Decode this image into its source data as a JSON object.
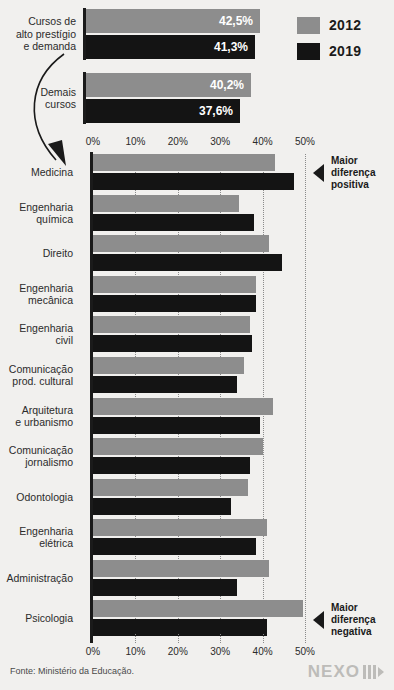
{
  "legend": {
    "items": [
      {
        "label": "2012",
        "color": "#8d8d8d"
      },
      {
        "label": "2019",
        "color": "#141414"
      }
    ]
  },
  "summary": {
    "groups": [
      {
        "label": "Cursos de alto prestígio e demanda",
        "bars": [
          {
            "series": "2012",
            "value": 42.5,
            "value_label": "42,5%"
          },
          {
            "series": "2019",
            "value": 41.3,
            "value_label": "41,3%"
          }
        ]
      },
      {
        "label": "Demais cursos",
        "bars": [
          {
            "series": "2012",
            "value": 40.2,
            "value_label": "40,2%"
          },
          {
            "series": "2019",
            "value": 37.6,
            "value_label": "37,6%"
          }
        ]
      }
    ]
  },
  "callouts": [
    {
      "id": "maior-diferenca-positiva",
      "text": "Maior diferença positiva",
      "icon": "triangle-left-icon"
    },
    {
      "id": "maior-diferenca-negativa",
      "text": "Maior diferença negativa",
      "icon": "triangle-left-icon"
    }
  ],
  "footer": {
    "source": "Fonte: Ministério da Educação.",
    "logo": "NEXO"
  },
  "chart_data": {
    "type": "bar",
    "orientation": "horizontal",
    "title": "",
    "subtitle": "",
    "xlabel": "",
    "ylabel": "",
    "xlim": [
      0,
      50
    ],
    "grid": true,
    "legend_position": "top-right",
    "tick_labels": [
      "0%",
      "10%",
      "20%",
      "30%",
      "40%",
      "50%"
    ],
    "ticks": [
      0,
      10,
      20,
      30,
      40,
      50
    ],
    "categories": [
      "Medicina",
      "Engenharia química",
      "Direito",
      "Engenharia mecânica",
      "Engenharia civil",
      "Comunicação prod. cultural",
      "Arquitetura e urbanismo",
      "Comunicação jornalismo",
      "Odontologia",
      "Engenharia elétrica",
      "Administração",
      "Psicologia"
    ],
    "category_lines": [
      [
        "Medicina"
      ],
      [
        "Engenharia",
        "química"
      ],
      [
        "Direito"
      ],
      [
        "Engenharia",
        "mecânica"
      ],
      [
        "Engenharia",
        "civil"
      ],
      [
        "Comunicação",
        "prod. cultural"
      ],
      [
        "Arquitetura",
        "e urbanismo"
      ],
      [
        "Comunicação",
        "jornalismo"
      ],
      [
        "Odontologia"
      ],
      [
        "Engenharia",
        "elétrica"
      ],
      [
        "Administração"
      ],
      [
        "Psicologia"
      ]
    ],
    "series": [
      {
        "name": "2012",
        "color": "#8d8d8d",
        "values": [
          43.0,
          34.5,
          41.5,
          38.5,
          37.0,
          35.5,
          42.5,
          40.0,
          36.5,
          41.0,
          41.5,
          49.5
        ]
      },
      {
        "name": "2019",
        "color": "#141414",
        "values": [
          47.5,
          38.0,
          44.5,
          38.5,
          37.5,
          34.0,
          39.5,
          37.0,
          32.5,
          38.5,
          34.0,
          41.0
        ]
      }
    ],
    "annotations": [
      {
        "category": "Medicina",
        "text": "Maior diferença positiva"
      },
      {
        "category": "Psicologia",
        "text": "Maior diferença negativa"
      }
    ]
  }
}
